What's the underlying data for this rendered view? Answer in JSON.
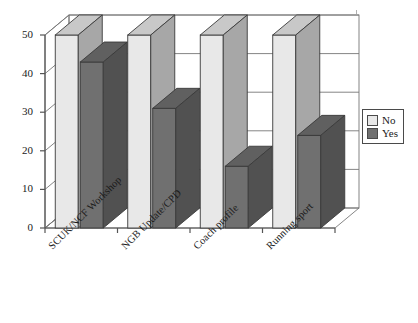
{
  "chart_data": {
    "type": "bar",
    "title": "",
    "xlabel": "",
    "ylabel": "",
    "ylim": [
      0,
      50
    ],
    "yticks": [
      0,
      10,
      20,
      30,
      40,
      50
    ],
    "grid": true,
    "legend_position": "right",
    "three_d": true,
    "categories": [
      "SCUK/NCF Workshop",
      "NGB Update/CPD",
      "Coach profile",
      "Running sport"
    ],
    "series": [
      {
        "name": "No",
        "color": "#e8e8e8",
        "values": [
          50,
          50,
          50,
          50
        ]
      },
      {
        "name": "Yes",
        "color": "#707070",
        "values": [
          43,
          31,
          16,
          24
        ]
      }
    ]
  },
  "legend": {
    "items": [
      {
        "label": "No",
        "color": "#e8e8e8"
      },
      {
        "label": "Yes",
        "color": "#707070"
      }
    ]
  },
  "colors": {
    "series_no": "#e8e8e8",
    "series_yes": "#707070",
    "axis": "#555555",
    "grid": "#777777",
    "text": "#1a1a1a",
    "background": "#ffffff"
  }
}
